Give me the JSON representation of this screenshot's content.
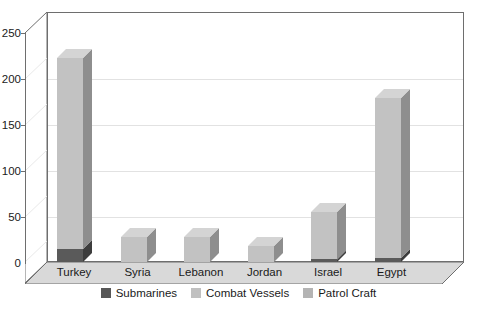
{
  "chart_data": {
    "type": "bar",
    "title": "",
    "xlabel": "",
    "ylabel": "",
    "categories": [
      "Turkey",
      "Syria",
      "Lebanon",
      "Jordan",
      "Israel",
      "Egypt"
    ],
    "series": [
      {
        "name": "Submarines",
        "values": [
          14,
          0,
          0,
          0,
          3,
          4
        ]
      },
      {
        "name": "Combat Vessels",
        "values": [
          209,
          27,
          27,
          18,
          52,
          175
        ]
      },
      {
        "name": "Patrol Craft",
        "values": [
          0,
          0,
          0,
          0,
          0,
          0
        ]
      }
    ],
    "totals": [
      223,
      27,
      27,
      18,
      55,
      179
    ],
    "ylim": [
      0,
      250
    ],
    "yticks": [
      0,
      50,
      100,
      150,
      200,
      250
    ],
    "ytick_labels": [
      "0",
      "50",
      "100",
      "150",
      "200",
      "250"
    ],
    "grid": true,
    "legend_position": "bottom",
    "style": "3d-column"
  },
  "axis": {
    "y_labels": [
      "250",
      "200",
      "150",
      "100",
      "50",
      "0"
    ]
  },
  "legend": {
    "items": [
      {
        "label": "Submarines",
        "color": "#575757"
      },
      {
        "label": "Combat Vessels",
        "color": "#c0c0c0"
      },
      {
        "label": "Patrol Craft",
        "color": "#b4b4b4"
      }
    ]
  },
  "colors": {
    "submarines_face": "#5a5a5a",
    "submarines_side": "#3d3d3d",
    "submarines_top": "#6e6e6e",
    "combat_face": "#c2c2c2",
    "combat_side": "#8e8e8e",
    "combat_top": "#d4d4d4",
    "floor": "#d9d9d9",
    "wall_border": "#6e6e6e",
    "gridline": "#e2e2e2",
    "text": "#1a1a1a"
  },
  "categories_labels": {
    "c0": "Turkey",
    "c1": "Syria",
    "c2": "Lebanon",
    "c3": "Jordan",
    "c4": "Israel",
    "c5": "Egypt"
  }
}
